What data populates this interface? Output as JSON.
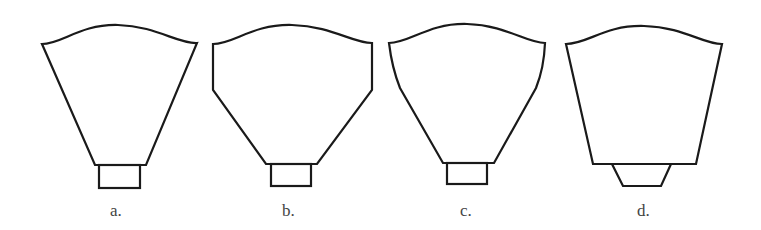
{
  "figure": {
    "type": "diagram",
    "stroke_color": "#1a1a1a",
    "background_color": "#ffffff",
    "items": [
      {
        "id": "a",
        "label": "a.",
        "body": "inverted trapezoid with straight tapering sides",
        "base": "rectangle"
      },
      {
        "id": "b",
        "label": "b.",
        "body": "vertical upper sides then angled taper (hexagonal)",
        "base": "rectangle"
      },
      {
        "id": "c",
        "label": "c.",
        "body": "slightly bowed upper sides then angled taper",
        "base": "rectangle"
      },
      {
        "id": "d",
        "label": "d.",
        "body": "gently tapering trapezoid with wide flat bottom",
        "base": "small trapezoid"
      }
    ]
  }
}
